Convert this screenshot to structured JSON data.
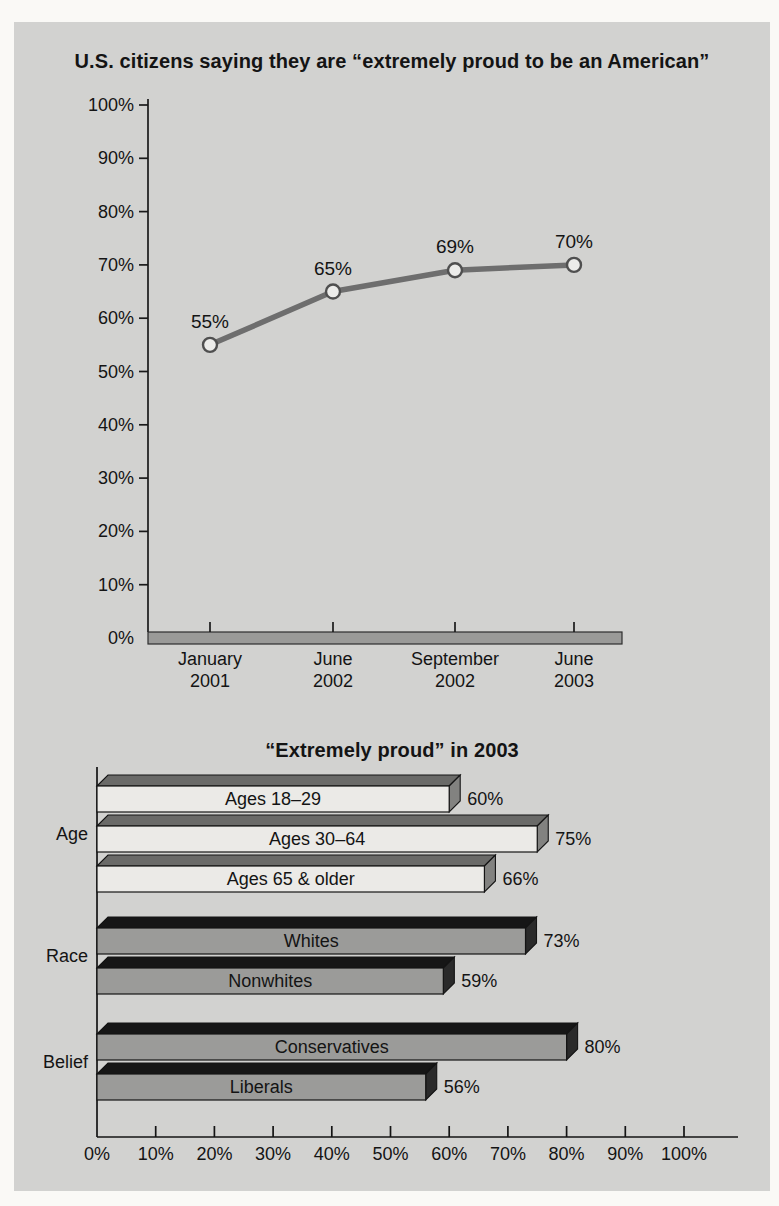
{
  "page": {
    "background": "#faf9f6"
  },
  "panel": {
    "background": "#d2d2d0"
  },
  "chart_data": [
    {
      "type": "line",
      "title": "U.S. citizens saying they are “extremely proud to be an American”",
      "xlabel": "",
      "ylabel": "",
      "ylim": [
        0,
        100
      ],
      "ytick_step": 10,
      "ytick_labels": [
        "0%",
        "10%",
        "20%",
        "30%",
        "40%",
        "50%",
        "60%",
        "70%",
        "80%",
        "90%",
        "100%"
      ],
      "categories": [
        [
          "January",
          "2001"
        ],
        [
          "June",
          "2002"
        ],
        [
          "September",
          "2002"
        ],
        [
          "June",
          "2003"
        ]
      ],
      "values": [
        55,
        65,
        69,
        70
      ],
      "point_labels": [
        "55%",
        "65%",
        "69%",
        "70%"
      ],
      "grid": false,
      "legend": "none",
      "line_color": "#6e6e6e",
      "marker": "open-circle",
      "marker_fill": "#ececea",
      "marker_stroke": "#4f4f4f",
      "axis_color": "#1a1a1a",
      "axis_band_color": "#9a9a98"
    },
    {
      "type": "bar",
      "orientation": "horizontal",
      "title": "“Extremely proud” in 2003",
      "xlabel": "",
      "ylabel": "",
      "xlim": [
        0,
        100
      ],
      "xtick_step": 10,
      "xtick_labels": [
        "0%",
        "10%",
        "20%",
        "30%",
        "40%",
        "50%",
        "60%",
        "70%",
        "80%",
        "90%",
        "100%"
      ],
      "groups": [
        {
          "label": "Age",
          "style": "light",
          "bars": [
            {
              "label": "Ages 18–29",
              "value": 60,
              "value_label": "60%"
            },
            {
              "label": "Ages 30–64",
              "value": 75,
              "value_label": "75%"
            },
            {
              "label": "Ages 65 & older",
              "value": 66,
              "value_label": "66%"
            }
          ]
        },
        {
          "label": "Race",
          "style": "dark",
          "bars": [
            {
              "label": "Whites",
              "value": 73,
              "value_label": "73%"
            },
            {
              "label": "Nonwhites",
              "value": 59,
              "value_label": "59%"
            }
          ]
        },
        {
          "label": "Belief",
          "style": "dark",
          "bars": [
            {
              "label": "Conservatives",
              "value": 80,
              "value_label": "80%"
            },
            {
              "label": "Liberals",
              "value": 56,
              "value_label": "56%"
            }
          ]
        }
      ],
      "bar_styles": {
        "light": {
          "face": "#ebeae7",
          "bevel": "#6a6a68",
          "cap": "#828280"
        },
        "dark": {
          "face": "#9b9b99",
          "bevel": "#161616",
          "cap": "#2a2a2a"
        }
      },
      "outline_color": "#141414",
      "grid": false,
      "legend": "none"
    }
  ]
}
